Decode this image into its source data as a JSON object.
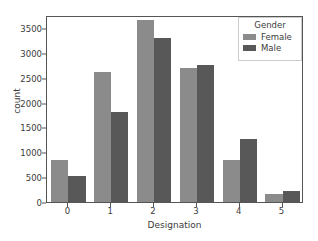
{
  "chart_data": {
    "type": "bar",
    "title": "",
    "xlabel": "Designation",
    "ylabel": "count",
    "categories": [
      "0",
      "1",
      "2",
      "3",
      "4",
      "5"
    ],
    "series": [
      {
        "name": "Female",
        "color": "#8b8b8b",
        "values": [
          840,
          2610,
          3650,
          2690,
          850,
          170
        ]
      },
      {
        "name": "Male",
        "color": "#585858",
        "values": [
          520,
          1800,
          3290,
          2745,
          1270,
          220
        ]
      }
    ],
    "ylim": [
      0,
      3760
    ],
    "yticks": [
      0,
      500,
      1000,
      1500,
      2000,
      2500,
      3000,
      3500
    ],
    "ytick_labels": [
      "0",
      "500",
      "1000",
      "1500",
      "2000",
      "2500",
      "3000",
      "3500"
    ],
    "xtick_labels": [
      "0",
      "1",
      "2",
      "3",
      "4",
      "5"
    ],
    "grid": false,
    "legend": {
      "title": "Gender",
      "position": "upper right",
      "entries": [
        "Female",
        "Male"
      ]
    }
  },
  "figure": {
    "background": "#ffffff",
    "axes_color": "#555555",
    "text_color": "#3b3b3b"
  }
}
